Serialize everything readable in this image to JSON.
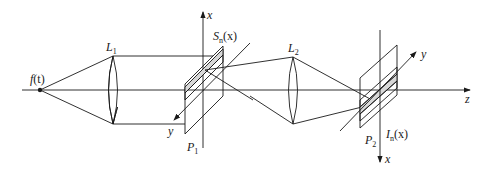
{
  "diagram": {
    "type": "optical-4f-system",
    "colors": {
      "line": "#1a1a1a",
      "slit_fill": "#d8d8d8",
      "background": "#ffffff"
    },
    "labels": {
      "source": {
        "main": "f",
        "arg": "(t)"
      },
      "lens1": {
        "main": "L",
        "sub": "1"
      },
      "lens2": {
        "main": "L",
        "sub": "2"
      },
      "plane1": {
        "main": "P",
        "sub": "1"
      },
      "plane2": {
        "main": "P",
        "sub": "2"
      },
      "slit_function": {
        "main": "S",
        "sub": "n",
        "arg": "(x)"
      },
      "intensity": {
        "main": "I",
        "sub": "n",
        "arg": "(x)"
      },
      "axis_x_top": "x",
      "axis_y_left": "y",
      "axis_y_right": "y",
      "axis_x_bottom": "x",
      "axis_z": "z"
    }
  }
}
